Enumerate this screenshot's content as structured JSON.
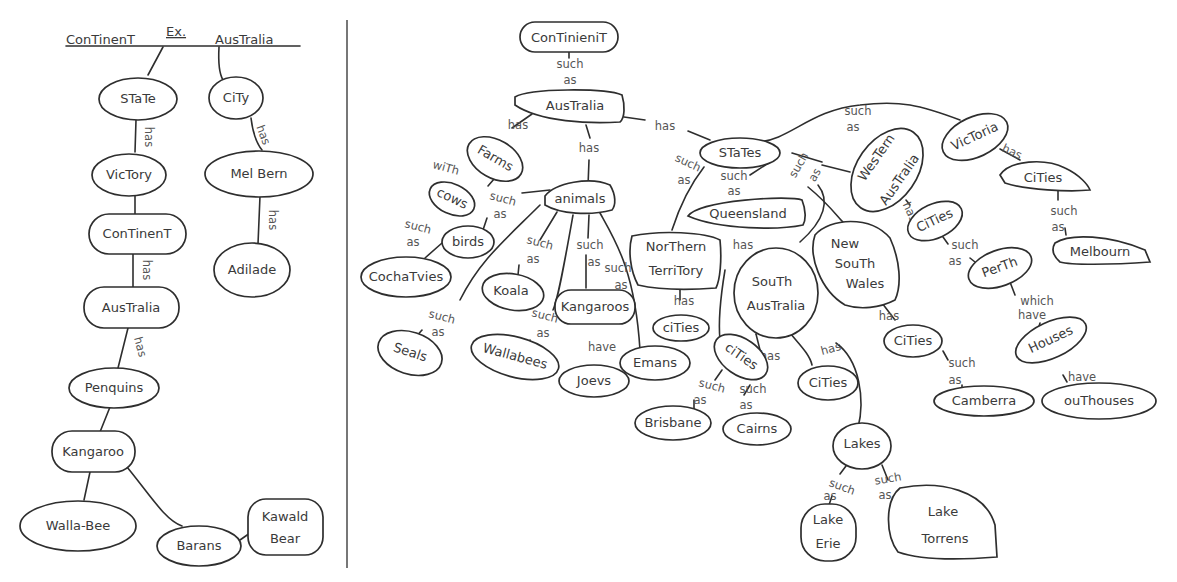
{
  "left_panel": {
    "header": {
      "left": "ConTinenT",
      "example_marker": "Ex.",
      "right": "AusTralia"
    },
    "nodes": {
      "state": "STaTe",
      "city": "CiTy",
      "victory": "VicTory",
      "mel_bern": "Mel Bern",
      "continent": "ConTinenT",
      "adilade": "Adilade",
      "australia": "AusTralia",
      "penquins": "Penquins",
      "kangaroo": "Kangaroo",
      "walla_bee": "Walla-Bee",
      "barans": "Barans",
      "kawald_bear_1": "Kawald",
      "kawald_bear_2": "Bear"
    },
    "links": {
      "state_victory": "has",
      "city_melbern": "has",
      "melbern_adilade": "has",
      "continent_australia": "has",
      "australia_penquins": "has"
    }
  },
  "right_panel": {
    "nodes": {
      "continent": "ConTinieniT",
      "australia": "AusTralia",
      "farms": "Farms",
      "cows": "cows",
      "animals": "animals",
      "birds": "birds",
      "cochatvies": "CochaTvies",
      "koala": "Koala",
      "kangaroos": "Kangaroos",
      "seals": "Seals",
      "wallabees": "Wallabees",
      "joevs": "Joevs",
      "emans": "Emans",
      "states": "STaTes",
      "queensland": "Queensland",
      "northern_territory_1": "NorThern",
      "northern_territory_2": "TerriTory",
      "nt_cities": "ciTies",
      "qld_cities": "ciTies",
      "brisbane": "Brisbane",
      "cairns": "Cairns",
      "south_australia_1": "SouTh",
      "south_australia_2": "AusTralia",
      "sa_cities": "CiTies",
      "lakes": "Lakes",
      "lake_erie_1": "Lake",
      "lake_erie_2": "Erie",
      "lake_torrens_1": "Lake",
      "lake_torrens_2": "Torrens",
      "nsw_1": "New",
      "nsw_2": "SouTh",
      "nsw_3": "Wales",
      "nsw_cities": "CiTies",
      "camberra": "Camberra",
      "wa_1": "WesTern",
      "wa_2": "AusTralia",
      "wa_cities": "CiTies",
      "perth": "PerTh",
      "houses": "Houses",
      "outhouses": "ouThouses",
      "victoria": "VicToria",
      "vic_cities": "CiTies",
      "melbourn": "Melbourn"
    },
    "links": {
      "such": "such",
      "as": "as",
      "has": "has",
      "with": "wiTh",
      "have": "have",
      "which": "which",
      "has_dash": "has"
    }
  }
}
